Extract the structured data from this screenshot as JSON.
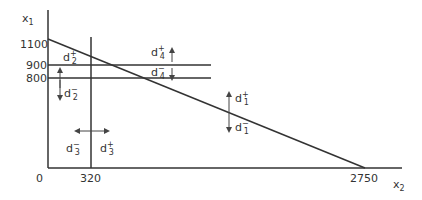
{
  "axes": {
    "x_label": "x",
    "x_label_sub": "2",
    "y_label": "x",
    "y_label_sub": "1",
    "origin": "0"
  },
  "ticks": {
    "y": [
      "1100",
      "900",
      "800"
    ],
    "x": [
      "320",
      "2750"
    ]
  },
  "deviations": {
    "d1_plus": {
      "base": "d",
      "sup": "+",
      "sub": "1"
    },
    "d1_minus": {
      "base": "d",
      "sup": "−",
      "sub": "1"
    },
    "d2_plus": {
      "base": "d",
      "sup": "+",
      "sub": "2"
    },
    "d2_minus": {
      "base": "d",
      "sup": "−",
      "sub": "2"
    },
    "d3_plus": {
      "base": "d",
      "sup": "+",
      "sub": "3"
    },
    "d3_minus": {
      "base": "d",
      "sup": "−",
      "sub": "3"
    },
    "d4_plus": {
      "base": "d",
      "sup": "+",
      "sub": "4"
    },
    "d4_minus": {
      "base": "d",
      "sup": "−",
      "sub": "4"
    }
  },
  "colors": {
    "line": "#333333",
    "text": "#333333",
    "background": "#ffffff"
  }
}
